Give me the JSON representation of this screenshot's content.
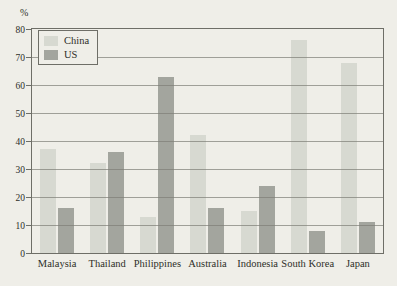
{
  "chart_data": {
    "type": "bar",
    "title": "",
    "ylabel": "%",
    "ylim": [
      0,
      80
    ],
    "ytick_step": 10,
    "grid": true,
    "legend_position": "top-left",
    "categories": [
      "Malaysia",
      "Thailand",
      "Philippines",
      "Australia",
      "Indonesia",
      "South Korea",
      "Japan"
    ],
    "series": [
      {
        "name": "China",
        "color": "#d7d9d1",
        "values": [
          37,
          32,
          13,
          42,
          15,
          76,
          68
        ]
      },
      {
        "name": "US",
        "color": "#a3a59e",
        "values": [
          16,
          36,
          63,
          16,
          24,
          8,
          11
        ]
      }
    ]
  },
  "colors": {
    "background": "#efeee8",
    "grid": "#7d7d76",
    "border": "#6e6e67",
    "text": "#2e2e28"
  }
}
